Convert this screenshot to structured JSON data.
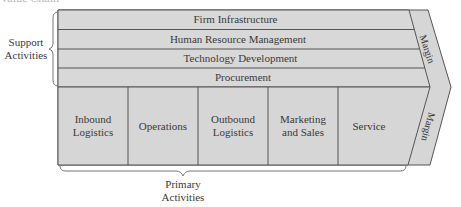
{
  "caption": "Value Chain",
  "colors": {
    "fill": "#d6d6d6",
    "stroke": "#555555",
    "text": "#3a3a3a"
  },
  "support": {
    "label_line1": "Support",
    "label_line2": "Activities",
    "rows": [
      {
        "label": "Firm Infrastructure"
      },
      {
        "label": "Human Resource Management"
      },
      {
        "label": "Technology Development"
      },
      {
        "label": "Procurement"
      }
    ]
  },
  "primary": {
    "label_line1": "Primary",
    "label_line2": "Activities",
    "columns": [
      {
        "line1": "Inbound",
        "line2": "Logistics"
      },
      {
        "line1": "Operations",
        "line2": ""
      },
      {
        "line1": "Outbound",
        "line2": "Logistics"
      },
      {
        "line1": "Marketing",
        "line2": "and Sales"
      },
      {
        "line1": "Service",
        "line2": ""
      }
    ]
  },
  "margin": {
    "top_label": "Margin",
    "bottom_label": "Margin"
  }
}
